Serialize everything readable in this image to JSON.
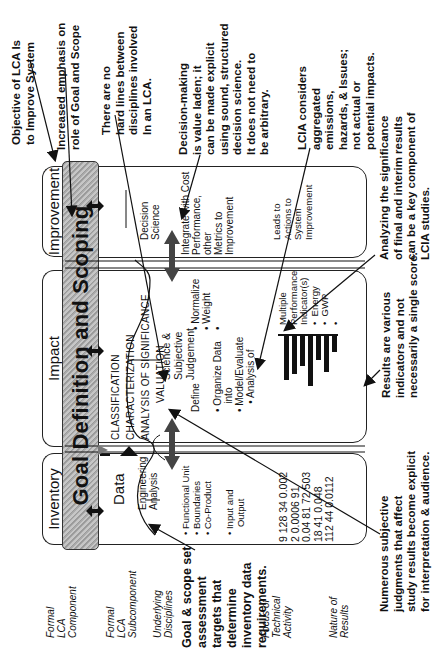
{
  "figure": {
    "orientation": "rotated 90deg counter-clockwise",
    "row_labels": [
      {
        "id": "formal-lca-component",
        "text": "Formal\nLCA\nComponent"
      },
      {
        "id": "formal-lca-subcomponent",
        "text": "Formal\nLCA\nSubcomponent"
      },
      {
        "id": "underlying-disciplines",
        "text": "Underlying\nDisciplines"
      },
      {
        "id": "focus-of-technical-activity",
        "text": "Focus of\nTechnical\nActivity"
      },
      {
        "id": "nature-of-results",
        "text": "Nature of\nResults"
      }
    ],
    "goal_bar": {
      "label": "Goal Definition and Scoping"
    },
    "components": {
      "inventory": {
        "tab_label": "Inventory",
        "subcomponent": "Data",
        "discipline": "Engineering\nAnalysis",
        "activity": "• Functional Unit\n• Boundaries\n• Co-Product\n\n• Input and\n   Output",
        "results": "9 128 34 0.002\n2 0.0006 91\n0.04 81 72 503\n18 41 0.048\n112 44 0.0112"
      },
      "impact": {
        "tab_label": "Impact",
        "subcomponents": "CLASSIFICATION\nCHARACTERIZATION\nANALYSIS OF SIGNIFICANCE\n            VALUATION",
        "discipline": "Science &\nSubjective\nJudgement",
        "activity_left": "Define\n\n• Organize Data\n   into\n• Model/Evaluate\n   • Analysis of",
        "activity_right": "• Normalize\n• Weight\n•",
        "results": "Multiple\nPerformance\nIndicator(s)\n•  Energy\n•  GWP\n•",
        "bar_chart_heights": [
          44,
          38,
          30,
          50,
          24,
          36,
          16
        ]
      },
      "improvement": {
        "tab_label": "Improvement",
        "discipline": "Decision\nScience",
        "activity": "Integrate with Cost\nPerformance,\nother\nMetrics to\nImprovement",
        "results": "Leads to\nActions to\nSystem\nImprovement"
      }
    },
    "annotations": [
      {
        "id": "objective",
        "text": "Objective of LCA Is\nto Improve System"
      },
      {
        "id": "goal-scope-emphasis",
        "text": "Increased emphasis on\nrole of Goal and Scope"
      },
      {
        "id": "no-hard-lines",
        "text": "There are no\nhard lines between\ndisciplines involved\nIn an LCA."
      },
      {
        "id": "decision-making",
        "text": "Decision-making\nis value laden; it\ncan be made explicit\nusing sound, structured\ndecision science.\nIt does not need to\nbe arbitrary."
      },
      {
        "id": "lcia-considers",
        "text": "LCIA considers\naggregated\nemissions,\nhazards, & Issues;\nnot actual or\npotential impacts."
      },
      {
        "id": "analyzing-significance",
        "text": "Analyzing the significance\nof final and interim results\ncan be a key component of\nLCIA studies."
      },
      {
        "id": "results-various",
        "text": "Results are various\nindicators and not\nnecessarily a single score."
      },
      {
        "id": "numerous-judgments",
        "text": "Numerous subjective\njudgments that affect\nstudy results become explicit\nfor interpretation & audience."
      },
      {
        "id": "goal-scope-targets",
        "text": "Goal & scope set\nassessment\ntargets that\ndetermine\ninventory data\nrequirements."
      }
    ]
  }
}
